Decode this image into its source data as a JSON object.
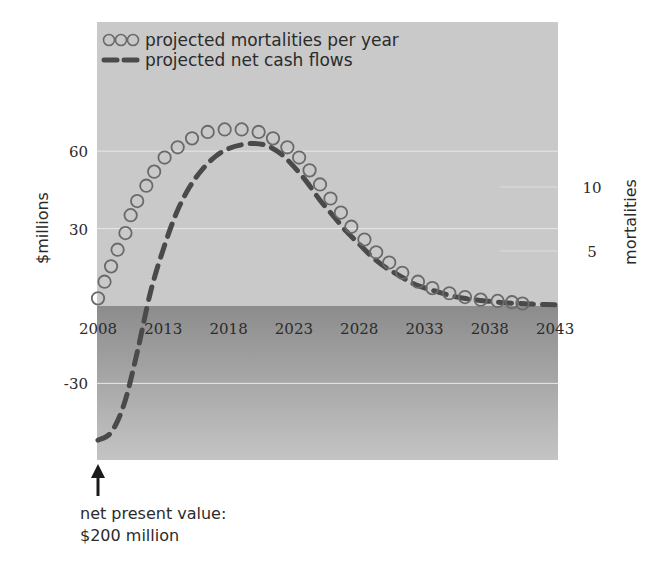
{
  "chart_data": {
    "type": "line",
    "title": "",
    "legend": {
      "position": "top-left inside",
      "entries": [
        {
          "marker": "open-circles",
          "label": "projected mortalities per year"
        },
        {
          "marker": "dashed-line",
          "label": "projected net cash flows"
        }
      ]
    },
    "x_axis": {
      "label": "",
      "ticks": [
        "2008",
        "2013",
        "2018",
        "2023",
        "2028",
        "2033",
        "2038",
        "2043"
      ],
      "range": [
        2008,
        2043
      ]
    },
    "y_axis_left": {
      "label": "$millions",
      "ticks": [
        "-30",
        "30",
        "60"
      ],
      "range": [
        -60,
        110
      ]
    },
    "y_axis_right": {
      "label": "mortalities",
      "ticks": [
        "5",
        "10"
      ],
      "range": [
        0,
        25
      ]
    },
    "grid": true,
    "series": [
      {
        "name": "projected mortalities per year",
        "axis": "right",
        "style": "open-circles",
        "x": [
          2008.0,
          2008.5,
          2009.0,
          2009.5,
          2010.1,
          2010.5,
          2011.0,
          2011.7,
          2012.3,
          2013.1,
          2014.1,
          2015.2,
          2016.4,
          2017.7,
          2019.0,
          2020.3,
          2021.4,
          2022.5,
          2023.4,
          2024.2,
          2025.0,
          2025.8,
          2026.6,
          2027.4,
          2028.4,
          2029.3,
          2030.3,
          2031.3,
          2032.5,
          2033.6,
          2034.9,
          2036.1,
          2037.3,
          2038.6,
          2039.7,
          2040.5
        ],
        "values": [
          1.3,
          2.6,
          3.8,
          5.1,
          6.4,
          7.8,
          8.9,
          10.1,
          11.2,
          12.3,
          13.1,
          13.8,
          14.3,
          14.5,
          14.5,
          14.3,
          13.8,
          13.1,
          12.3,
          11.3,
          10.2,
          9.1,
          8.0,
          6.9,
          5.9,
          4.9,
          4.1,
          3.3,
          2.6,
          2.1,
          1.7,
          1.4,
          1.2,
          1.1,
          1.0,
          0.9
        ]
      },
      {
        "name": "projected net cash flows",
        "axis": "left",
        "style": "dashed",
        "x": [
          2008,
          2009,
          2010,
          2011,
          2012,
          2013,
          2014,
          2015,
          2016,
          2017,
          2018,
          2019,
          2020,
          2021,
          2022,
          2023,
          2024,
          2025,
          2026,
          2027,
          2028,
          2029,
          2030,
          2031,
          2032,
          2033,
          2034,
          2035,
          2036,
          2037,
          2038,
          2039,
          2040,
          2041,
          2042,
          2043
        ],
        "values": [
          -52,
          -49,
          -38,
          -18,
          5,
          22,
          36,
          46,
          53,
          58,
          61,
          62.5,
          63,
          62,
          59,
          54,
          48,
          41,
          35,
          29,
          24,
          19,
          15,
          12,
          9,
          7,
          5.5,
          4,
          3,
          2.3,
          1.8,
          1.3,
          1,
          0.8,
          0.6,
          0.5
        ]
      }
    ],
    "annotations": [
      {
        "text": "net present value: $200 million",
        "points_to": "2008, y-min (arrow up)"
      }
    ]
  },
  "legend": {
    "circles_label": "projected mortalities per year",
    "dashed_label": "projected net cash flows"
  },
  "axes": {
    "left_title": "$millions",
    "right_title": "mortalities",
    "left_ticks": [
      {
        "label": "60",
        "value": 60
      },
      {
        "label": "30",
        "value": 30
      },
      {
        "label": "-30",
        "value": -30
      }
    ],
    "right_ticks": [
      {
        "label": "10",
        "value": 10
      },
      {
        "label": "5",
        "value": 5
      }
    ],
    "x_ticks": [
      "2008",
      "2013",
      "2018",
      "2023",
      "2028",
      "2033",
      "2038",
      "2043"
    ]
  },
  "annotation": {
    "line1": "net present value:",
    "line2": "$200 million"
  },
  "colors": {
    "upper_bg": "#c9c9c9",
    "lower_bg_top": "#8e8e8e",
    "lower_bg_bottom": "#c2c2c2",
    "series": "#5a5a5a",
    "dash": "#4a4a4a",
    "gridline": "#e8e8e8"
  }
}
